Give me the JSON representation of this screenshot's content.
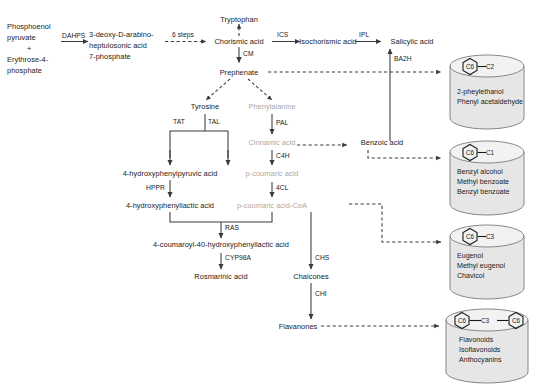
{
  "diagram": {
    "colors": {
      "line": "#3a3a3a",
      "text": "#1a1a1a",
      "faded_text": "#a8a8a8",
      "cylinder_fill": "#e6e6e6",
      "cylinder_top": "#f2f2f2",
      "cylinder_stroke": "#7a7a7a"
    },
    "nodes": [
      {
        "id": "pep",
        "label": "Phosphoenol",
        "faded": false
      },
      {
        "id": "pep2",
        "label": "pyruvate",
        "faded": false
      },
      {
        "id": "plus",
        "label": "+",
        "faded": false
      },
      {
        "id": "e4p",
        "label": "Erythrose-4-",
        "faded": false
      },
      {
        "id": "e4p2",
        "label": "phosphate",
        "faded": false
      },
      {
        "id": "dahp1",
        "label": "3-deoxy-D-arabino-",
        "faded": false
      },
      {
        "id": "dahp2",
        "label": "heptulosonic acid",
        "faded": false
      },
      {
        "id": "dahp3",
        "label": "7-phosphate",
        "faded": false
      },
      {
        "id": "tryptophan",
        "label": "Tryptophan",
        "faded": false
      },
      {
        "id": "chorismic",
        "label": "Chorismic acid",
        "faded": false
      },
      {
        "id": "isochorismic",
        "label": "Isochorismic acid",
        "faded": false
      },
      {
        "id": "salicylic",
        "label": "Salicylic acid",
        "faded": false
      },
      {
        "id": "prephenate",
        "label": "Prephenate",
        "faded": false
      },
      {
        "id": "tyrosine",
        "label": "Tyrosine",
        "faded": false
      },
      {
        "id": "phenylalanine",
        "label": "Phenylalanine",
        "faded": true
      },
      {
        "id": "cinnamic",
        "label": "Cinnamic acid",
        "faded": true
      },
      {
        "id": "benzoic",
        "label": "Benzoic acid",
        "faded": false
      },
      {
        "id": "hpp",
        "label": "4-hydroxyphenylpyruvic acid",
        "faded": false
      },
      {
        "id": "pcoumaric",
        "label": "p-coumaric acid",
        "faded": true
      },
      {
        "id": "hpl",
        "label": "4-hydroxyphenyllactic acid",
        "faded": false
      },
      {
        "id": "pcoumcoa",
        "label": "p-coumaric acid-CoA",
        "faded": true
      },
      {
        "id": "coumaroyl",
        "label": "4-coumaroyl-40-hydroxyphenyllactic acid",
        "faded": false
      },
      {
        "id": "rosmarinic",
        "label": "Rosmarinic acid",
        "faded": false
      },
      {
        "id": "chalcones",
        "label": "Chalcones",
        "faded": false
      },
      {
        "id": "flavanones",
        "label": "Flavanones",
        "faded": false
      }
    ],
    "enzymes": [
      {
        "id": "dahps",
        "label": "DAHPS"
      },
      {
        "id": "steps",
        "label": "6 steps"
      },
      {
        "id": "ics",
        "label": "ICS"
      },
      {
        "id": "ipl",
        "label": "IPL"
      },
      {
        "id": "cm",
        "label": "CM"
      },
      {
        "id": "ba2h",
        "label": "BA2H"
      },
      {
        "id": "tat",
        "label": "TAT"
      },
      {
        "id": "tal",
        "label": "TAL"
      },
      {
        "id": "pal",
        "label": "PAL"
      },
      {
        "id": "c4h",
        "label": "C4H"
      },
      {
        "id": "hppr",
        "label": "HPPR"
      },
      {
        "id": "fourcl",
        "label": "4CL"
      },
      {
        "id": "ras",
        "label": "RAS"
      },
      {
        "id": "cyp98a",
        "label": "CYP98A"
      },
      {
        "id": "chs",
        "label": "CHS"
      },
      {
        "id": "chi",
        "label": "CHI"
      }
    ],
    "products": [
      {
        "id": "c6c2",
        "ring_left": "C6",
        "bond": "—",
        "ring_right": "C2",
        "ring_right_is_hex": false,
        "items": [
          "2-pheylethanol",
          "Phenyl acetaldehyde"
        ]
      },
      {
        "id": "c6c1",
        "ring_left": "C6",
        "bond": "—",
        "ring_right": "C1",
        "ring_right_is_hex": false,
        "items": [
          "Benzyl alcohol",
          "Methyl benzoate",
          "Benzyl benzoate"
        ]
      },
      {
        "id": "c6c3",
        "ring_left": "C6",
        "bond": "—",
        "ring_right": "C3",
        "ring_right_is_hex": false,
        "items": [
          "Eugenol",
          "Methyl eugenol",
          "Chavicol"
        ]
      },
      {
        "id": "c6c3c6",
        "ring_left": "C6",
        "bond": "—",
        "ring_right": "C3",
        "ring_right_is_hex": true,
        "ring_third": "C6",
        "items": [
          "Flavonoids",
          "Isoflavonoids",
          "Anthocyanins"
        ]
      }
    ]
  }
}
